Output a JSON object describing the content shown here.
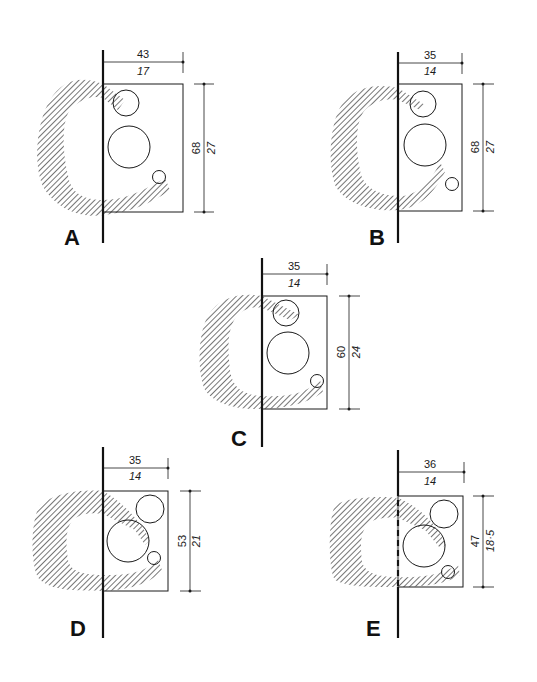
{
  "figure": {
    "colors": {
      "ink": "#1a1a1a",
      "hatch": "#3a3a3a",
      "background": "#ffffff"
    },
    "panels": [
      {
        "label": "A",
        "width_cm": "43",
        "width_in": "17",
        "depth_cm": "68",
        "depth_in": "27"
      },
      {
        "label": "B",
        "width_cm": "35",
        "width_in": "14",
        "depth_cm": "68",
        "depth_in": "27"
      },
      {
        "label": "C",
        "width_cm": "35",
        "width_in": "14",
        "depth_cm": "60",
        "depth_in": "24"
      },
      {
        "label": "D",
        "width_cm": "35",
        "width_in": "14",
        "depth_cm": "53",
        "depth_in": "21"
      },
      {
        "label": "E",
        "width_cm": "36",
        "width_in": "14",
        "depth_cm": "47",
        "depth_in": "18·5"
      }
    ]
  }
}
